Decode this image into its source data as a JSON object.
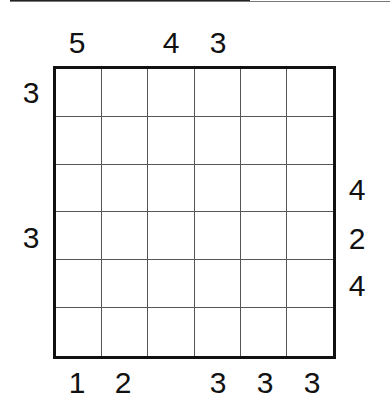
{
  "puzzle": {
    "rows": 6,
    "cols": 6,
    "cells": [
      [
        "",
        "",
        "",
        "",
        "",
        ""
      ],
      [
        "",
        "",
        "",
        "",
        "",
        ""
      ],
      [
        "",
        "",
        "",
        "",
        "",
        ""
      ],
      [
        "",
        "",
        "",
        "",
        "",
        ""
      ],
      [
        "",
        "",
        "",
        "",
        "",
        ""
      ],
      [
        "",
        "",
        "",
        "",
        "",
        ""
      ]
    ],
    "clues": {
      "top": [
        "5",
        "",
        "4",
        "3",
        "",
        ""
      ],
      "bottom": [
        "1",
        "2",
        "",
        "3",
        "3",
        "3"
      ],
      "left": [
        "3",
        "",
        "",
        "3",
        "",
        ""
      ],
      "right": [
        "",
        "",
        "4",
        "2",
        "4",
        ""
      ]
    }
  },
  "colors": {
    "grid_border": "#111111",
    "grid_line": "#555555",
    "background": "#ffffff"
  }
}
